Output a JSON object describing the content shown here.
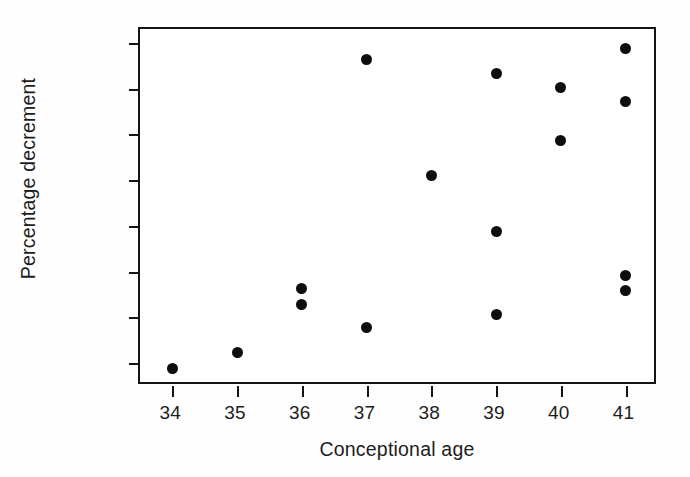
{
  "chart_data": {
    "type": "scatter",
    "title": "",
    "xlabel": "Conceptional age",
    "ylabel": "Percentage decrement",
    "xlim": [
      33.5,
      41.5
    ],
    "ylim": [
      -90.0,
      -12.0
    ],
    "xticks": [
      34,
      35,
      36,
      37,
      38,
      39,
      40,
      41
    ],
    "xtick_labels": [
      "34",
      "35",
      "36",
      "37",
      "38",
      "39",
      "40",
      "41"
    ],
    "yticks": [
      -15,
      -25,
      -35,
      -45,
      -55,
      -65,
      -75,
      -85
    ],
    "ytick_labels": [
      "−15",
      "−25",
      "−35",
      "−45",
      "−55",
      "−65",
      "−75",
      "−85"
    ],
    "grid": false,
    "legend": null,
    "marker": "filled-circle",
    "marker_color": "#0d0d0d",
    "marker_size_px": 11,
    "frame_color": "#141414",
    "background_color": "#ffffff",
    "n_points": 16,
    "x": [
      34,
      35,
      36,
      36,
      37,
      37,
      38,
      39,
      39,
      39,
      40,
      40,
      41,
      41,
      41,
      41
    ],
    "y": [
      -86.1,
      -82.6,
      -68.8,
      -72.3,
      -18.7,
      -77.3,
      -43.9,
      -21.8,
      -56.2,
      -74.3,
      -24.7,
      -36.3,
      -16.3,
      -27.9,
      -65.9,
      -69.2
    ],
    "points": [
      {
        "x": 34,
        "y": -86.1
      },
      {
        "x": 35,
        "y": -82.6
      },
      {
        "x": 36,
        "y": -68.8
      },
      {
        "x": 36,
        "y": -72.3
      },
      {
        "x": 37,
        "y": -18.7
      },
      {
        "x": 37,
        "y": -77.3
      },
      {
        "x": 38,
        "y": -43.9
      },
      {
        "x": 39,
        "y": -21.8
      },
      {
        "x": 39,
        "y": -56.2
      },
      {
        "x": 39,
        "y": -74.3
      },
      {
        "x": 40,
        "y": -24.7
      },
      {
        "x": 40,
        "y": -36.3
      },
      {
        "x": 41,
        "y": -16.3
      },
      {
        "x": 41,
        "y": -27.9
      },
      {
        "x": 41,
        "y": -65.9
      },
      {
        "x": 41,
        "y": -69.2
      }
    ]
  }
}
